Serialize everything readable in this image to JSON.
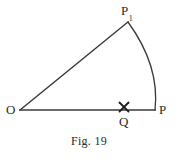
{
  "figure": {
    "caption": "Fig. 19",
    "background_color": "#ffffff",
    "stroke_color": "#3a3a3a",
    "text_color": "#2b2b2b"
  },
  "labels": {
    "origin": "O",
    "point_p": "P",
    "point_p1_base": "P",
    "point_p1_subscript": "1",
    "point_q": "Q"
  },
  "geometry": {
    "points": {
      "O": {
        "x": 20,
        "y": 110
      },
      "P": {
        "x": 155,
        "y": 110
      },
      "P1": {
        "x": 128,
        "y": 22
      },
      "Q": {
        "x": 124,
        "y": 107
      }
    },
    "segments": [
      {
        "name": "OP-baseline",
        "from": "O",
        "to": "P"
      },
      {
        "name": "OP1-radius",
        "from": "O",
        "to": "P1"
      }
    ],
    "arc": {
      "name": "arc-P-to-P1",
      "from": "P1",
      "to": "P",
      "radius": 142,
      "bulge_x": 157
    },
    "cross_marker": {
      "name": "Q-cross",
      "center_x": 124,
      "center_y": 107,
      "size": 9
    }
  }
}
